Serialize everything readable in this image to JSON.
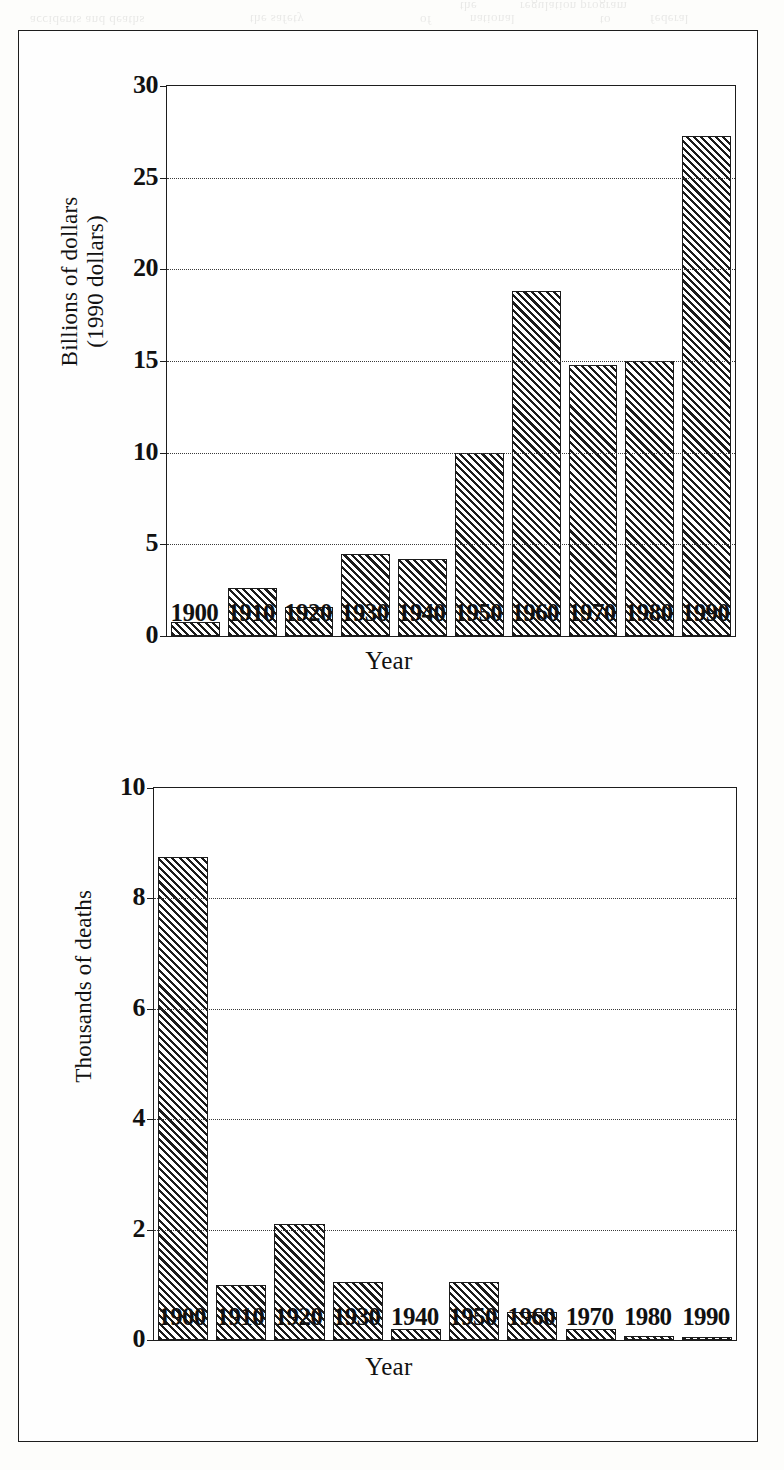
{
  "page": {
    "background_color": "#fdfdfb",
    "frame_color": "#1d1d1d",
    "bar_fill_color": "#1b1b1b",
    "bleed_text": [
      "accidents and deaths",
      "the safety",
      "of",
      "national",
      "to",
      "federal",
      "the",
      "regulation program"
    ]
  },
  "chart_data": [
    {
      "id": "billions-of-dollars",
      "type": "bar",
      "title": "",
      "xlabel": "Year",
      "ylabel": "Billions of dollars\n(1990 dollars)",
      "ylabel_line1": "Billions of dollars",
      "ylabel_line2": "(1990 dollars)",
      "categories": [
        "1900",
        "1910",
        "1920",
        "1930",
        "1940",
        "1950",
        "1960",
        "1970",
        "1980",
        "1990"
      ],
      "values": [
        0.75,
        2.6,
        1.6,
        4.5,
        4.2,
        10.0,
        18.8,
        14.8,
        15.0,
        27.3
      ],
      "ylim": [
        0,
        30
      ],
      "yticks": [
        0,
        5,
        10,
        15,
        20,
        25,
        30
      ],
      "ytick_labels": [
        "0",
        "5",
        "10",
        "15",
        "20",
        "25",
        "30"
      ],
      "grid": true,
      "grid_style": "dotted-horizontal",
      "legend": "none"
    },
    {
      "id": "thousands-of-deaths",
      "type": "bar",
      "title": "",
      "xlabel": "Year",
      "ylabel": "Thousands of deaths",
      "ylabel_line1": "Thousands of deaths",
      "ylabel_line2": "",
      "categories": [
        "1900",
        "1910",
        "1920",
        "1930",
        "1940",
        "1950",
        "1960",
        "1970",
        "1980",
        "1990"
      ],
      "values": [
        8.75,
        1.0,
        2.1,
        1.05,
        0.2,
        1.05,
        0.5,
        0.2,
        0.08,
        0.05
      ],
      "ylim": [
        0,
        10
      ],
      "yticks": [
        0,
        2,
        4,
        6,
        8,
        10
      ],
      "ytick_labels": [
        "0",
        "2",
        "4",
        "6",
        "8",
        "10"
      ],
      "grid": true,
      "grid_style": "dotted-horizontal",
      "legend": "none"
    }
  ]
}
